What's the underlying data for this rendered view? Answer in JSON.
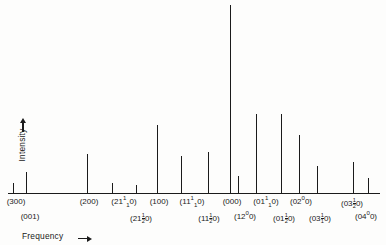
{
  "axes": {
    "y_label": "Intensity",
    "y_arrow": "up-arrow",
    "x_label": "Frequency",
    "x_arrow": "right-arrow"
  },
  "chart_data": {
    "type": "bar",
    "title": "",
    "xlabel": "Frequency",
    "ylabel": "Intensity",
    "grid": false,
    "legend": null,
    "ylim": [
      0,
      100
    ],
    "note": "Stick spectrum: vibrational transition bands labelled by quantum-number triples. Heights are relative intensities read from the plot; x values are pixel-frequency positions along the horizontal axis.",
    "categories": [
      "(300)",
      "(001)",
      "(200)",
      "(21¹10)",
      "(21½0)",
      "(100)",
      "(11¹10)",
      "(11½0)",
      "(000)",
      "(12⁰0)",
      "(01¹10)",
      "(01½0)",
      "(02⁰0)",
      "(03¹10)",
      "(03½0)",
      "(04⁰0)"
    ],
    "x": [
      13,
      26,
      87,
      112,
      136,
      157,
      181,
      208,
      230,
      238,
      256,
      281,
      299,
      317,
      353,
      368
    ],
    "values": [
      5,
      11,
      20,
      5,
      4,
      35,
      19,
      21,
      97,
      9,
      41,
      41,
      30,
      14,
      16,
      8
    ],
    "points": [
      {
        "label": "(300)",
        "row": "top",
        "x": 13,
        "height": 5
      },
      {
        "label": "(001)",
        "row": "bottom",
        "x": 26,
        "height": 11
      },
      {
        "label": "(200)",
        "row": "top",
        "x": 87,
        "height": 20
      },
      {
        "label": "(21¹10)",
        "row": "top",
        "x": 112,
        "height": 5
      },
      {
        "label": "(21½0)",
        "row": "bottom",
        "x": 136,
        "height": 4
      },
      {
        "label": "(100)",
        "row": "top",
        "x": 157,
        "height": 35
      },
      {
        "label": "(11¹10)",
        "row": "top",
        "x": 181,
        "height": 19
      },
      {
        "label": "(11½0)",
        "row": "bottom",
        "x": 208,
        "height": 21
      },
      {
        "label": "(000)",
        "row": "top",
        "x": 230,
        "height": 97
      },
      {
        "label": "(12⁰0)",
        "row": "bottom",
        "x": 238,
        "height": 9
      },
      {
        "label": "(01¹10)",
        "row": "top",
        "x": 256,
        "height": 41
      },
      {
        "label": "(01½0)",
        "row": "bottom",
        "x": 281,
        "height": 41
      },
      {
        "label": "(02⁰0)",
        "row": "top",
        "x": 299,
        "height": 30
      },
      {
        "label": "(03¹10)",
        "row": "bottom",
        "x": 317,
        "height": 14
      },
      {
        "label": "(03½0)",
        "row": "top",
        "x": 353,
        "height": 16
      },
      {
        "label": "(04⁰0)",
        "row": "bottom",
        "x": 368,
        "height": 8
      }
    ]
  },
  "tick_labels_top": [
    {
      "id": "300",
      "x": 16,
      "text": "(300)"
    },
    {
      "id": "200",
      "x": 89,
      "text": "(200)"
    },
    {
      "id": "21_1_0",
      "x": 124,
      "prefix": "(21",
      "sup": "1",
      "sub": "1",
      "suffix": "0)"
    },
    {
      "id": "100",
      "x": 159,
      "text": "(100)"
    },
    {
      "id": "11_1_0",
      "x": 192,
      "prefix": "(11",
      "sup": "1",
      "sub": "1",
      "suffix": "0)"
    },
    {
      "id": "000",
      "x": 232,
      "text": "(000)"
    },
    {
      "id": "01_1_0",
      "x": 266,
      "prefix": "(01",
      "sup": "1",
      "sub": "1",
      "suffix": "0)"
    },
    {
      "id": "02_0_0",
      "x": 301,
      "prefix": "(02",
      "sup": "0",
      "sub": "",
      "suffix": "0)"
    },
    {
      "id": "03_12_0",
      "x": 352,
      "prefix": "(03",
      "frac": "1/2",
      "suffix": "0)"
    }
  ],
  "tick_labels_bottom": [
    {
      "id": "001",
      "x": 30,
      "text": "(001)"
    },
    {
      "id": "21_12_0",
      "x": 141,
      "prefix": "(21",
      "frac": "1/2",
      "suffix": "0)"
    },
    {
      "id": "11_12_0",
      "x": 209,
      "prefix": "(11",
      "frac": "1/2",
      "suffix": "0)"
    },
    {
      "id": "12_0_0",
      "x": 245,
      "prefix": "(12",
      "sup": "0",
      "sub": "",
      "suffix": "0)"
    },
    {
      "id": "01_12_0",
      "x": 284,
      "prefix": "(01",
      "frac": "1/2",
      "suffix": "0)"
    },
    {
      "id": "03_1_0",
      "x": 320,
      "prefix": "(03",
      "frac": "1/1",
      "suffix": "0)"
    },
    {
      "id": "04_0_0",
      "x": 366,
      "prefix": "(04",
      "sup": "0",
      "sub": "",
      "suffix": "0)"
    }
  ]
}
